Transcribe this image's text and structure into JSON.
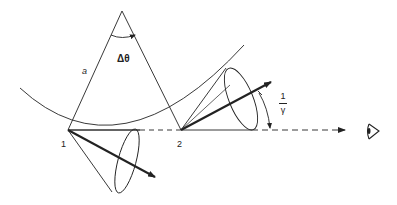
{
  "diagram": {
    "type": "synchrotron radiation emission geometry",
    "labels": {
      "radius": "a",
      "angle": "Δθ",
      "point1": "1",
      "point2": "2",
      "cone_angle_numerator": "1",
      "cone_angle_denominator": "γ"
    },
    "elements": [
      "circular orbit arc",
      "radius lines from center to points 1 and 2",
      "angle arc Δθ at center",
      "emission cone at point 1 with velocity arrow",
      "emission cone at point 2 with velocity arrow",
      "dashed line of sight toward observer",
      "angle arrow 1/γ",
      "observer eye symbol"
    ],
    "colors": {
      "stroke": "#222222",
      "background": "#ffffff"
    }
  }
}
